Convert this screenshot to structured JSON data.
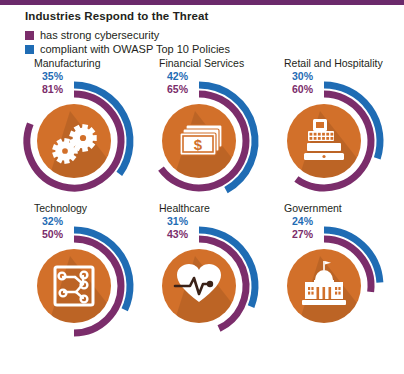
{
  "title": "Industries Respond to the Threat",
  "colors": {
    "purple": "#7b2d6b",
    "blue": "#1f6cb4",
    "orange": "#d2702a",
    "text": "#231f20",
    "topbar": "#6b2a6b",
    "icon": "#ffffff"
  },
  "legend": [
    {
      "label": "has strong cybersecurity",
      "color": "#7b2d6b",
      "swatch": "legend-swatch-purple"
    },
    {
      "label": "compliant with OWASP Top 10 Policies",
      "color": "#1f6cb4",
      "swatch": "legend-swatch-blue"
    }
  ],
  "chart_data": {
    "type": "pie",
    "title": "Industries Respond to the Threat",
    "legend_position": "top-left",
    "series": [
      {
        "name": "has strong cybersecurity",
        "color": "#7b2d6b",
        "values": [
          81,
          65,
          60,
          50,
          43,
          27
        ]
      },
      {
        "name": "compliant with OWASP Top 10 Policies",
        "color": "#1f6cb4",
        "values": [
          35,
          42,
          30,
          32,
          31,
          24
        ]
      }
    ],
    "categories": [
      "Manufacturing",
      "Financial Services",
      "Retail and Hospitality",
      "Technology",
      "Healthcare",
      "Government"
    ],
    "units": "percent",
    "ylim": [
      0,
      100
    ]
  },
  "industries": [
    {
      "name": "Manufacturing",
      "icon": "gears-icon",
      "blue_pct": "35%",
      "purple_pct": "81%",
      "blue_value": 35,
      "purple_value": 81
    },
    {
      "name": "Financial Services",
      "icon": "banknotes-dollar-icon",
      "blue_pct": "42%",
      "purple_pct": "65%",
      "blue_value": 42,
      "purple_value": 65
    },
    {
      "name": "Retail and Hospitality",
      "icon": "cash-register-icon",
      "blue_pct": "30%",
      "purple_pct": "60%",
      "blue_value": 30,
      "purple_value": 60
    },
    {
      "name": "Technology",
      "icon": "circuit-board-icon",
      "blue_pct": "32%",
      "purple_pct": "50%",
      "blue_value": 32,
      "purple_value": 50
    },
    {
      "name": "Healthcare",
      "icon": "heart-ekg-icon",
      "blue_pct": "31%",
      "purple_pct": "43%",
      "blue_value": 31,
      "purple_value": 43
    },
    {
      "name": "Government",
      "icon": "government-building-icon",
      "blue_pct": "24%",
      "purple_pct": "27%",
      "blue_value": 24,
      "purple_value": 27
    }
  ]
}
